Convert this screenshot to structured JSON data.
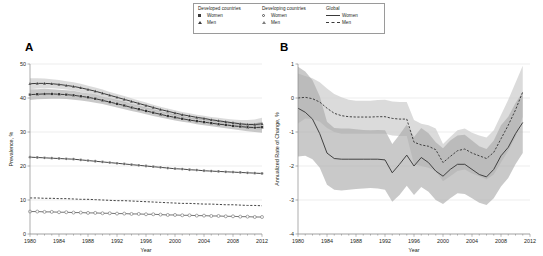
{
  "figure": {
    "panel_a_label": "A",
    "panel_b_label": "B",
    "caption": ""
  },
  "legend": {
    "groups": [
      {
        "title": "Developed countries",
        "items": [
          {
            "label": "Women",
            "marker": "filled-square-icon"
          },
          {
            "label": "Men",
            "marker": "filled-triangle-icon"
          }
        ]
      },
      {
        "title": "Developing countries",
        "items": [
          {
            "label": "Women",
            "marker": "open-circle-icon"
          },
          {
            "label": "Men",
            "marker": "open-triangle-icon"
          }
        ]
      },
      {
        "title": "Global",
        "items": [
          {
            "label": "Women",
            "marker": "solid-line-icon"
          },
          {
            "label": "Men",
            "marker": "dashed-line-icon"
          }
        ]
      }
    ]
  },
  "colors": {
    "line_dark": "#3a3a3a",
    "line_mid": "#6f6f6f",
    "band_outer": "#cfcfcf",
    "band_inner": "#a8a8a8",
    "axis": "#8a8a8a",
    "grid": "#d9d9d9"
  },
  "chart_data": [
    {
      "type": "line",
      "panel": "A",
      "title": "",
      "xlabel": "Year",
      "ylabel": "Prevalence, %",
      "xlim": [
        1980,
        2012
      ],
      "ylim": [
        0,
        50
      ],
      "xticks": [
        1980,
        1984,
        1988,
        1992,
        1996,
        2000,
        2004,
        2008,
        2012
      ],
      "xticklabels": [
        "1980",
        "1984",
        "1988",
        "1992",
        "1996",
        "2000",
        "2004",
        "2008",
        "2012"
      ],
      "yticks": [
        0,
        10,
        20,
        30,
        40,
        50
      ],
      "yticklabels": [
        "0",
        "10",
        "20",
        "30",
        "40",
        "50"
      ],
      "grid": true,
      "x": [
        1980,
        1981,
        1982,
        1983,
        1984,
        1985,
        1986,
        1987,
        1988,
        1989,
        1990,
        1991,
        1992,
        1993,
        1994,
        1995,
        1996,
        1997,
        1998,
        1999,
        2000,
        2001,
        2002,
        2003,
        2004,
        2005,
        2006,
        2007,
        2008,
        2009,
        2010,
        2011,
        2012
      ],
      "series": [
        {
          "name": "Developed countries, Men",
          "marker": "filled-triangle-icon",
          "style": "markers-band",
          "values": [
            44.2,
            44.3,
            44.3,
            44.2,
            44.0,
            43.7,
            43.4,
            43.0,
            42.5,
            42.0,
            41.4,
            40.8,
            40.2,
            39.6,
            39.0,
            38.4,
            37.8,
            37.2,
            36.6,
            36.1,
            35.6,
            35.1,
            34.7,
            34.3,
            34.0,
            33.6,
            33.3,
            33.0,
            32.7,
            32.4,
            32.2,
            32.2,
            32.4
          ],
          "ci_lower": [
            42.6,
            42.8,
            42.9,
            42.9,
            42.7,
            42.5,
            42.2,
            41.8,
            41.4,
            40.9,
            40.3,
            39.8,
            39.2,
            38.6,
            38.1,
            37.5,
            36.9,
            36.4,
            35.8,
            35.3,
            34.8,
            34.4,
            34.0,
            33.6,
            33.2,
            32.9,
            32.5,
            32.2,
            31.8,
            31.4,
            31.0,
            30.8,
            30.7
          ],
          "ci_upper": [
            45.8,
            45.8,
            45.7,
            45.5,
            45.3,
            44.9,
            44.6,
            44.2,
            43.6,
            43.1,
            42.5,
            41.8,
            41.2,
            40.6,
            39.9,
            39.3,
            38.7,
            38.0,
            37.4,
            36.9,
            36.4,
            35.9,
            35.5,
            35.1,
            34.8,
            34.4,
            34.2,
            33.9,
            33.7,
            33.5,
            33.5,
            33.7,
            34.2
          ]
        },
        {
          "name": "Developed countries, Women",
          "marker": "filled-square-icon",
          "style": "markers-band",
          "values": [
            41.0,
            41.1,
            41.2,
            41.2,
            41.1,
            41.0,
            40.8,
            40.5,
            40.2,
            39.8,
            39.3,
            38.8,
            38.3,
            37.8,
            37.2,
            36.7,
            36.2,
            35.7,
            35.2,
            34.7,
            34.3,
            33.9,
            33.5,
            33.2,
            32.9,
            32.6,
            32.3,
            32.1,
            31.8,
            31.6,
            31.4,
            31.3,
            31.4
          ],
          "ci_lower": [
            39.4,
            39.6,
            39.7,
            39.8,
            39.8,
            39.7,
            39.5,
            39.3,
            39.0,
            38.6,
            38.2,
            37.7,
            37.2,
            36.7,
            36.2,
            35.7,
            35.2,
            34.7,
            34.3,
            33.8,
            33.4,
            33.0,
            32.7,
            32.3,
            32.0,
            31.7,
            31.4,
            31.1,
            30.8,
            30.5,
            30.2,
            30.0,
            29.8
          ],
          "ci_upper": [
            42.6,
            42.6,
            42.7,
            42.6,
            42.4,
            42.3,
            42.1,
            41.7,
            41.4,
            41.0,
            40.4,
            39.9,
            39.4,
            38.9,
            38.2,
            37.7,
            37.2,
            36.7,
            36.1,
            35.6,
            35.2,
            34.8,
            34.3,
            34.1,
            33.8,
            33.5,
            33.2,
            33.1,
            32.8,
            32.7,
            32.6,
            32.6,
            33.0
          ]
        },
        {
          "name": "Global, Women",
          "marker": "solid-line-icon",
          "style": "line",
          "values": [
            22.6,
            22.5,
            22.4,
            22.3,
            22.2,
            22.1,
            22.0,
            21.8,
            21.6,
            21.4,
            21.2,
            21.0,
            20.8,
            20.6,
            20.4,
            20.2,
            20.0,
            19.8,
            19.6,
            19.4,
            19.2,
            19.1,
            18.9,
            18.8,
            18.6,
            18.5,
            18.4,
            18.3,
            18.2,
            18.1,
            18.0,
            17.9,
            17.8
          ],
          "overlay_marker": "filled-circle-icon"
        },
        {
          "name": "Global, Men",
          "marker": "dashed-line-icon",
          "style": "line",
          "values": [
            10.6,
            10.6,
            10.5,
            10.5,
            10.4,
            10.4,
            10.3,
            10.2,
            10.2,
            10.1,
            10.0,
            9.9,
            9.8,
            9.8,
            9.7,
            9.6,
            9.5,
            9.4,
            9.3,
            9.2,
            9.1,
            9.0,
            9.0,
            8.9,
            8.8,
            8.8,
            8.7,
            8.6,
            8.6,
            8.5,
            8.4,
            8.4,
            8.3
          ]
        },
        {
          "name": "Developing countries, Women",
          "marker": "open-circle-icon",
          "style": "markers",
          "values": [
            6.6,
            6.6,
            6.5,
            6.5,
            6.4,
            6.4,
            6.3,
            6.3,
            6.2,
            6.2,
            6.1,
            6.1,
            6.0,
            6.0,
            5.9,
            5.9,
            5.8,
            5.8,
            5.7,
            5.6,
            5.6,
            5.5,
            5.5,
            5.4,
            5.4,
            5.3,
            5.3,
            5.2,
            5.2,
            5.1,
            5.1,
            5.0,
            5.0
          ]
        }
      ]
    },
    {
      "type": "line",
      "panel": "B",
      "title": "",
      "xlabel": "Year",
      "ylabel": "Annualized Rate of Change, %",
      "xlim": [
        1980,
        2012
      ],
      "ylim": [
        -4,
        1
      ],
      "xticks": [
        1980,
        1984,
        1988,
        1992,
        1996,
        2000,
        2004,
        2008,
        2012
      ],
      "xticklabels": [
        "1980",
        "1984",
        "1988",
        "1992",
        "1996",
        "2000",
        "2004",
        "2008",
        "2012"
      ],
      "yticks": [
        -4,
        -3,
        -2,
        -1,
        0,
        1
      ],
      "yticklabels": [
        "-4",
        "-3",
        "-2",
        "-1",
        "0",
        "1"
      ],
      "grid": true,
      "x": [
        1980,
        1981,
        1982,
        1983,
        1984,
        1985,
        1986,
        1987,
        1988,
        1989,
        1990,
        1991,
        1992,
        1993,
        1994,
        1995,
        1996,
        1997,
        1998,
        1999,
        2000,
        2001,
        2002,
        2003,
        2004,
        2005,
        2006,
        2007,
        2008,
        2009,
        2010,
        2011
      ],
      "series": [
        {
          "name": "Men",
          "marker": "dashed-line-icon",
          "style": "dashed-band",
          "values": [
            0.0,
            0.02,
            -0.02,
            -0.12,
            -0.3,
            -0.45,
            -0.52,
            -0.55,
            -0.56,
            -0.56,
            -0.56,
            -0.55,
            -0.55,
            -0.6,
            -0.62,
            -0.62,
            -1.3,
            -1.38,
            -1.42,
            -1.52,
            -1.9,
            -1.72,
            -1.55,
            -1.5,
            -1.62,
            -1.7,
            -1.78,
            -1.6,
            -1.2,
            -0.8,
            -0.35,
            0.18
          ],
          "ci_lower": [
            -0.75,
            -0.6,
            -0.62,
            -0.7,
            -0.88,
            -1.0,
            -1.05,
            -1.05,
            -1.05,
            -1.05,
            -1.05,
            -1.05,
            -1.05,
            -1.1,
            -1.12,
            -1.12,
            -1.95,
            -2.0,
            -2.05,
            -2.15,
            -2.45,
            -2.3,
            -2.15,
            -2.1,
            -2.22,
            -2.3,
            -2.4,
            -2.25,
            -1.9,
            -1.55,
            -1.15,
            -0.55
          ],
          "ci_upper": [
            0.72,
            0.65,
            0.58,
            0.46,
            0.28,
            0.12,
            0.02,
            -0.05,
            -0.08,
            -0.08,
            -0.08,
            -0.06,
            -0.05,
            -0.1,
            -0.12,
            -0.12,
            -0.65,
            -0.76,
            -0.8,
            -0.9,
            -1.35,
            -1.15,
            -0.95,
            -0.9,
            -1.02,
            -1.1,
            -1.16,
            -0.95,
            -0.5,
            -0.05,
            0.45,
            0.95
          ]
        },
        {
          "name": "Women",
          "marker": "solid-line-icon",
          "style": "solid-band",
          "values": [
            -0.3,
            -0.42,
            -0.62,
            -1.05,
            -1.62,
            -1.78,
            -1.8,
            -1.8,
            -1.8,
            -1.8,
            -1.8,
            -1.8,
            -1.82,
            -2.2,
            -1.95,
            -1.68,
            -2.0,
            -1.75,
            -1.9,
            -2.15,
            -2.3,
            -2.1,
            -1.95,
            -1.95,
            -2.1,
            -2.25,
            -2.32,
            -2.1,
            -1.7,
            -1.45,
            -1.05,
            -0.72
          ],
          "ci_lower": [
            -1.72,
            -1.7,
            -1.8,
            -2.05,
            -2.55,
            -2.7,
            -2.72,
            -2.7,
            -2.68,
            -2.66,
            -2.65,
            -2.66,
            -2.7,
            -3.05,
            -2.85,
            -2.58,
            -2.85,
            -2.62,
            -2.76,
            -3.0,
            -3.12,
            -2.95,
            -2.8,
            -2.82,
            -2.95,
            -3.08,
            -3.15,
            -2.95,
            -2.6,
            -2.35,
            -1.95,
            -1.62
          ],
          "ci_upper": [
            0.92,
            0.78,
            0.52,
            0.05,
            -0.7,
            -0.88,
            -0.9,
            -0.9,
            -0.92,
            -0.94,
            -0.95,
            -0.94,
            -0.95,
            -1.35,
            -1.08,
            -0.78,
            -1.15,
            -0.88,
            -1.04,
            -1.3,
            -1.48,
            -1.25,
            -1.1,
            -1.08,
            -1.25,
            -1.42,
            -1.5,
            -1.25,
            -0.8,
            -0.55,
            -0.15,
            0.18
          ]
        }
      ]
    }
  ]
}
